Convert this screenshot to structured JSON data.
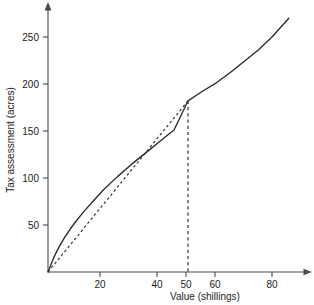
{
  "chart_data": {
    "type": "line",
    "title": "",
    "xlabel": "Value (shillings)",
    "ylabel": "Tax assessment (acres)",
    "xlim": [
      0,
      90
    ],
    "ylim": [
      0,
      285
    ],
    "grid": false,
    "legend": "none",
    "x_ticks": [
      20,
      40,
      50,
      60,
      80
    ],
    "x_tick_labels": [
      "20",
      "40",
      "50",
      "60",
      "80"
    ],
    "y_ticks": [
      50,
      100,
      150,
      200,
      250
    ],
    "y_tick_labels": [
      "50",
      "100",
      "150",
      "200",
      "250"
    ],
    "series": [
      {
        "name": "assessment-curve",
        "style": "solid",
        "x": [
          0,
          2,
          4,
          6,
          8,
          10,
          13,
          16,
          20,
          25,
          30,
          35,
          40,
          45,
          50,
          55,
          60,
          65,
          70,
          75,
          80,
          86
        ],
        "values": [
          0,
          15,
          27,
          37,
          46,
          54,
          65,
          75,
          88,
          102,
          115,
          127,
          139,
          151,
          182,
          192,
          201,
          212,
          224,
          236,
          250,
          270
        ]
      },
      {
        "name": "chord-line",
        "style": "dashed",
        "x": [
          0,
          50
        ],
        "values": [
          0,
          182
        ]
      },
      {
        "name": "reference-drop-line",
        "style": "dashed-vertical",
        "x": [
          50,
          50
        ],
        "values": [
          182,
          0
        ]
      }
    ],
    "annotations": [
      {
        "name": "chord-endpoint",
        "x": 50,
        "y": 182
      }
    ]
  },
  "axes": {
    "x_axis_name": "x-axis",
    "y_axis_name": "y-axis"
  }
}
